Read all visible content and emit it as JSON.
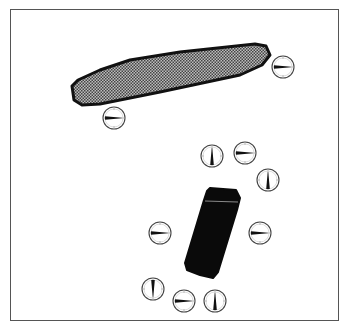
{
  "figure": {
    "colors": {
      "frame": "#555555",
      "magnet_shaded_fill": "#9a9a9a",
      "magnet_shaded_outline": "#111111",
      "magnet_solid_fill": "#0a0a0a",
      "compass_ring": "#444444",
      "needle": "#111111"
    },
    "magnets": [
      {
        "id": "shaded-bar",
        "style": "shaded",
        "path": "M72,86 L74,100 L82,105 L100,104 L160,92 L240,75 L262,65 L270,55 L266,46 L255,44 L180,52 L130,60 L100,70 L78,80 Z"
      },
      {
        "id": "solid-bar",
        "style": "solid",
        "path": "M210,188 L236,190 L240,198 L237,210 L218,272 L213,278 L200,275 L187,270 L185,263 L204,200 L207,191 Z"
      }
    ],
    "compasses": [
      {
        "id": "c1",
        "cx": 283,
        "cy": 67,
        "angle": 270
      },
      {
        "id": "c2",
        "cx": 114,
        "cy": 118,
        "angle": 270
      },
      {
        "id": "c3",
        "cx": 212,
        "cy": 156,
        "angle": 180
      },
      {
        "id": "c4",
        "cx": 245,
        "cy": 153,
        "angle": 270
      },
      {
        "id": "c5",
        "cx": 268,
        "cy": 180,
        "angle": 180
      },
      {
        "id": "c6",
        "cx": 160,
        "cy": 233,
        "angle": 270
      },
      {
        "id": "c7",
        "cx": 260,
        "cy": 233,
        "angle": 270
      },
      {
        "id": "c8",
        "cx": 153,
        "cy": 289,
        "angle": 0
      },
      {
        "id": "c9",
        "cx": 184,
        "cy": 301,
        "angle": 270
      },
      {
        "id": "c10",
        "cx": 215,
        "cy": 301,
        "angle": 180
      }
    ],
    "compass_radius": 11
  }
}
